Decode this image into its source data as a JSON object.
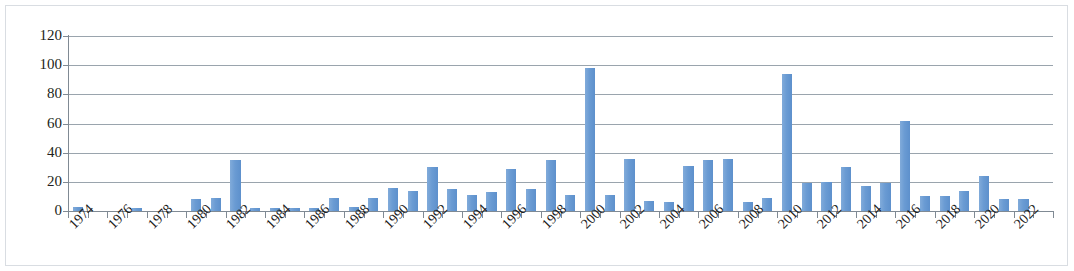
{
  "chart_data": {
    "type": "bar",
    "title": "",
    "subtitle": "",
    "xlabel": "",
    "ylabel": "",
    "ylim": [
      0,
      120
    ],
    "ytick_labels": [
      "120",
      "100",
      "80",
      "60",
      "40",
      "20",
      "0"
    ],
    "ytick_values": [
      120,
      100,
      80,
      60,
      40,
      20,
      0
    ],
    "grid": true,
    "grid_axis": "y",
    "legend": false,
    "legend_position": "none",
    "bar_color": "#6a9bd3",
    "axis_color": "#808a94",
    "gridline_color": "#9aa4ad",
    "frame_color": "#d9dde2",
    "xtick_labels": [
      "1974",
      "1976",
      "1978",
      "1980",
      "1982",
      "1984",
      "1986",
      "1988",
      "1990",
      "1992",
      "1994",
      "1996",
      "1998",
      "2000",
      "2002",
      "2004",
      "2006",
      "2008",
      "2010",
      "2012",
      "2014",
      "2016",
      "2018",
      "2020",
      "2022"
    ],
    "xtick_label_rotation": -45,
    "categories": [
      "1974",
      "1975",
      "1976",
      "1977",
      "1978",
      "1979",
      "1980",
      "1981",
      "1982",
      "1983",
      "1984",
      "1985",
      "1986",
      "1987",
      "1988",
      "1989",
      "1990",
      "1991",
      "1992",
      "1993",
      "1994",
      "1995",
      "1996",
      "1997",
      "1998",
      "1999",
      "2000",
      "2001",
      "2002",
      "2003",
      "2004",
      "2005",
      "2006",
      "2007",
      "2008",
      "2009",
      "2010",
      "2011",
      "2012",
      "2013",
      "2014",
      "2015",
      "2016",
      "2017",
      "2018",
      "2019",
      "2020",
      "2021",
      "2022",
      "2023"
    ],
    "values": [
      3,
      0,
      0,
      2,
      0,
      0,
      8,
      9,
      35,
      2,
      2,
      2,
      2,
      9,
      3,
      9,
      16,
      14,
      30,
      15,
      11,
      13,
      29,
      15,
      35,
      11,
      98,
      11,
      36,
      7,
      6,
      31,
      35,
      36,
      6,
      9,
      94,
      19,
      20,
      30,
      17,
      19,
      62,
      10,
      10,
      14,
      24,
      8,
      8,
      0
    ]
  }
}
